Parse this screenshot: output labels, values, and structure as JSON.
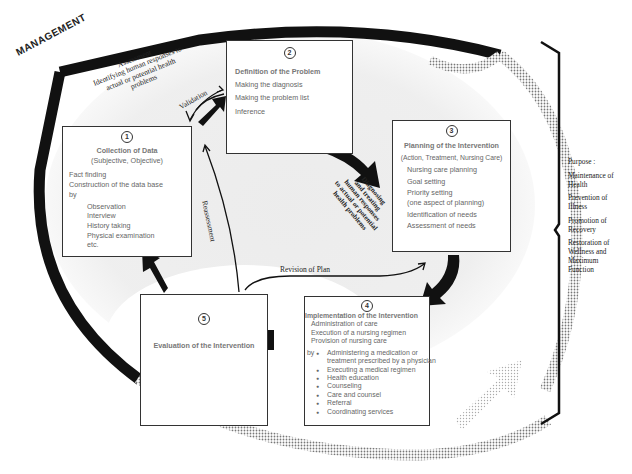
{
  "management_label": "MANAGEMENT",
  "assessment_arc": {
    "line1": "Assessment",
    "line2": "Identifying human responses to",
    "line3": "actual or potential health",
    "line4": "problems"
  },
  "validation_label": "Validation",
  "reassessment_label": "Reassessment",
  "revision_label": "Revision of Plan",
  "diagnosing_label": {
    "line1": "Diagnosing",
    "line2": "and treating",
    "line3": "human responses",
    "line4": "to actual or potential",
    "line5": "health problems"
  },
  "steps": [
    {
      "number": "1",
      "title": "Collection of Data",
      "subtitle": "(Subjective, Objective)",
      "lines": [
        "Fact finding",
        "Construction of the data base",
        "by"
      ],
      "methods": [
        "Observation",
        "Interview",
        "History taking",
        "Physical examination",
        "etc."
      ]
    },
    {
      "number": "2",
      "title": "Definition of the Problem",
      "lines": [
        "Making the diagnosis",
        "Making the problem list",
        "Inference"
      ]
    },
    {
      "number": "3",
      "title": "Planning of the Intervention",
      "subtitle": "(Action, Treatment, Nursing Care)",
      "lines": [
        "Nursing care planning",
        "Goal setting",
        "Priority setting",
        "(one aspect of planning)",
        "Identification of needs",
        "Assessment of needs"
      ]
    },
    {
      "number": "4",
      "title": "Implementation of the Intervention",
      "lines": [
        "Administration of care",
        "Execution of a nursing regimen",
        "Provision of nursing care"
      ],
      "by_label": "by",
      "bullets": [
        "Administering a medication or treatment prescribed by a physician",
        "Executing a medical regimen",
        "Health education",
        "Counseling",
        "Care and counsel",
        "Referral",
        "Coordinating services"
      ]
    },
    {
      "number": "5",
      "title": "Evaluation of the Intervention"
    }
  ],
  "purpose": {
    "heading": "Purpose :",
    "items": [
      "Maintenance of Health",
      "Prevention of Illness",
      "Promotion of Recovery",
      "Restoration of Wellness and Maximum Function"
    ]
  },
  "colors": {
    "stroke": "#111111",
    "shade": "#d9d9d9",
    "box_text": "#666666"
  }
}
